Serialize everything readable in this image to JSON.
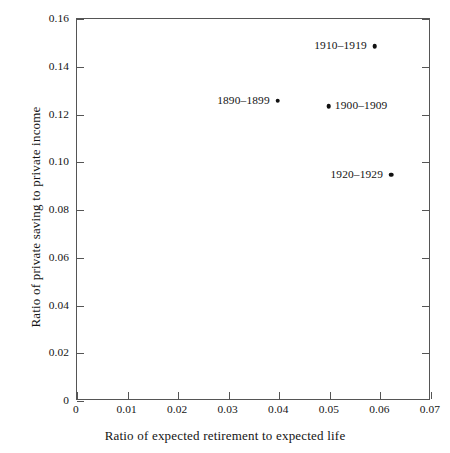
{
  "chart_data": {
    "type": "scatter",
    "title": "",
    "xlabel": "Ratio of expected retirement to expected life",
    "ylabel": "Ratio of private saving to private income",
    "xlim": [
      0,
      0.07
    ],
    "ylim": [
      0,
      0.16
    ],
    "grid": false,
    "legend": "none",
    "xticks": [
      "0",
      "0.01",
      "0.02",
      "0.03",
      "0.04",
      "0.05",
      "0.06",
      "0.07"
    ],
    "xtick_values": [
      0,
      0.01,
      0.02,
      0.03,
      0.04,
      0.05,
      0.06,
      0.07
    ],
    "yticks": [
      "0",
      "0.02",
      "0.04",
      "0.06",
      "0.08",
      "0.10",
      "0.12",
      "0.14",
      "0.16"
    ],
    "ytick_values": [
      0,
      0.02,
      0.04,
      0.06,
      0.08,
      0.1,
      0.12,
      0.14,
      0.16
    ],
    "points": [
      {
        "label": "1890–1899",
        "x": 0.0397,
        "y": 0.1257,
        "label_side": "left"
      },
      {
        "label": "1900–1909",
        "x": 0.0498,
        "y": 0.1235,
        "label_side": "right"
      },
      {
        "label": "1910–1919",
        "x": 0.0589,
        "y": 0.1487,
        "label_side": "left"
      },
      {
        "label": "1920–1929",
        "x": 0.0621,
        "y": 0.0947,
        "label_side": "left"
      }
    ],
    "marker_color": "#111111",
    "axis_color": "#555555",
    "background_color": "#ffffff"
  }
}
